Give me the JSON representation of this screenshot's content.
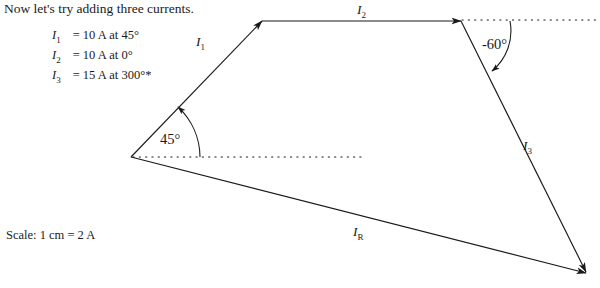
{
  "intro": {
    "text": "Now let's try adding three currents."
  },
  "given": {
    "rows": [
      {
        "symbol": "I",
        "sub": "1",
        "value": "= 10 A at 45°"
      },
      {
        "symbol": "I",
        "sub": "2",
        "value": "= 10 A at 0°"
      },
      {
        "symbol": "I",
        "sub": "3",
        "value": "= 15 A at 300°*"
      }
    ]
  },
  "scale": {
    "text": "Scale: 1 cm = 2 A"
  },
  "diagram": {
    "type": "vector-addition-polygon",
    "line_color": "#1a1a1a",
    "vectors": [
      {
        "name": "I1",
        "label": "I",
        "sublabel": "1",
        "magnitude": "10 A",
        "angle": "45°",
        "from": [
          131,
          157
        ],
        "to": [
          262,
          21
        ]
      },
      {
        "name": "I2",
        "label": "I",
        "sublabel": "2",
        "magnitude": "10 A",
        "angle": "0°",
        "from": [
          262,
          21
        ],
        "to": [
          461,
          21
        ]
      },
      {
        "name": "I3",
        "label": "I",
        "sublabel": "3",
        "magnitude": "15 A",
        "angle": "300°",
        "from": [
          461,
          21
        ],
        "to": [
          586,
          272
        ]
      },
      {
        "name": "IR",
        "label": "I",
        "sublabel": "R",
        "magnitude": "",
        "angle": "",
        "from": [
          131,
          157
        ],
        "to": [
          586,
          273
        ]
      }
    ],
    "reference_lines": [
      {
        "name": "origin-horizontal-dotted",
        "from": [
          133,
          157
        ],
        "to": [
          362,
          157
        ]
      },
      {
        "name": "top-right-horizontal-dotted",
        "from": [
          462,
          20
        ],
        "to": [
          596,
          20
        ]
      }
    ],
    "angles": [
      {
        "name": "angle-45",
        "label": "45°",
        "value": 45
      },
      {
        "name": "angle-minus-60",
        "label": "-60°",
        "value": -60
      }
    ]
  },
  "labels": {
    "i1": "I",
    "i1_sub": "1",
    "i2": "I",
    "i2_sub": "2",
    "i3": "I",
    "i3_sub": "3",
    "ir": "I",
    "ir_sub": "R",
    "angle45": "45°",
    "angle60": "-60°"
  }
}
